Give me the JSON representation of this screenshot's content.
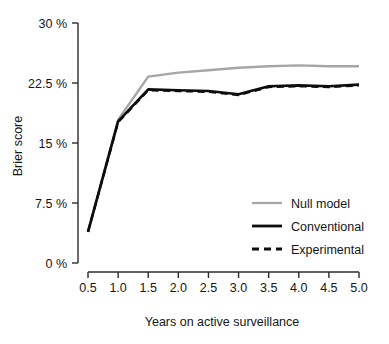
{
  "chart_data": {
    "type": "line",
    "title": "",
    "xlabel": "Years on active surveillance",
    "ylabel": "Brier score",
    "x": [
      0.5,
      1.0,
      1.5,
      2.0,
      2.5,
      3.0,
      3.5,
      4.0,
      4.5,
      5.0
    ],
    "xtick_labels": [
      "0.5",
      "1.0",
      "1.5",
      "2.0",
      "2.5",
      "3.0",
      "3.5",
      "4.0",
      "4.5",
      "5.0"
    ],
    "xlim": [
      0.5,
      5.0
    ],
    "ytick_labels": [
      "0 %",
      "7.5 %",
      "15 %",
      "22.5 %",
      "30 %"
    ],
    "ytick_values": [
      0,
      7.5,
      15,
      22.5,
      30
    ],
    "ylim": [
      0,
      30
    ],
    "grid": false,
    "legend_position": "bottom-right",
    "series": [
      {
        "name": "Null model",
        "color": "#a6a6a6",
        "style": "solid",
        "values": [
          3.9,
          17.9,
          23.3,
          23.8,
          24.1,
          24.4,
          24.6,
          24.7,
          24.6,
          24.6
        ]
      },
      {
        "name": "Conventional",
        "color": "#0d0d0d",
        "style": "solid",
        "values": [
          3.9,
          17.7,
          21.7,
          21.6,
          21.5,
          21.1,
          22.1,
          22.2,
          22.1,
          22.3
        ]
      },
      {
        "name": "Experimental",
        "color": "#0d0d0d",
        "style": "dashed",
        "values": [
          3.9,
          17.6,
          21.6,
          21.5,
          21.4,
          21.0,
          22.0,
          22.1,
          22.0,
          22.2
        ]
      }
    ]
  },
  "axis": {
    "y_title": "Brier score",
    "x_title": "Years on active surveillance"
  },
  "legend": {
    "items": [
      {
        "label": "Null model"
      },
      {
        "label": "Conventional"
      },
      {
        "label": "Experimental"
      }
    ]
  },
  "colors": {
    "null_model": "#a6a6a6",
    "conventional": "#0d0d0d",
    "experimental": "#0d0d0d",
    "axis": "#2b2b2b",
    "background": "#ffffff"
  }
}
